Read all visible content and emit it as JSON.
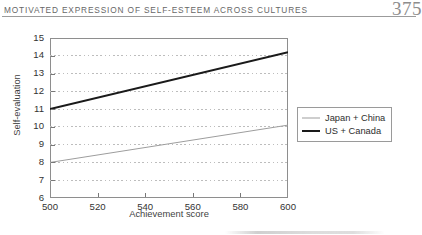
{
  "page": {
    "running_head": "Motivated Expression of Self-Esteem Across Cultures",
    "page_number": "375"
  },
  "chart_data": {
    "type": "line",
    "title": "",
    "xlabel": "Achievement score",
    "ylabel": "Self-evaluation",
    "xlim": [
      500,
      600
    ],
    "ylim": [
      6,
      15
    ],
    "xticks": [
      500,
      520,
      540,
      560,
      580,
      600
    ],
    "yticks": [
      6,
      7,
      8,
      9,
      10,
      11,
      12,
      13,
      14,
      15
    ],
    "grid": "horizontal-dotted",
    "legend_position": "right-outside-upper",
    "series": [
      {
        "name": "Japan + China",
        "color": "#9d9d9d",
        "width": 1,
        "x": [
          500,
          600
        ],
        "values": [
          8.0,
          10.1
        ]
      },
      {
        "name": "US + Canada",
        "color": "#1a1a1a",
        "width": 2,
        "x": [
          500,
          600
        ],
        "values": [
          11.0,
          14.2
        ]
      }
    ]
  }
}
